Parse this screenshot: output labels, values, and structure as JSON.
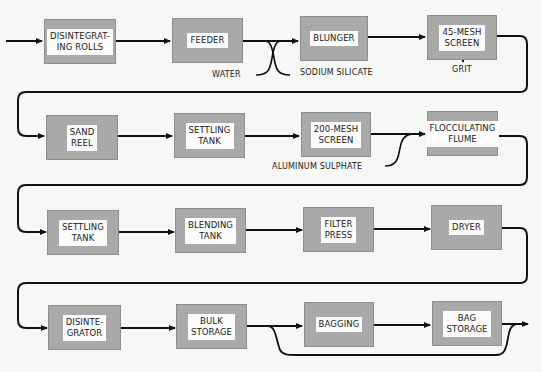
{
  "diagram": {
    "type": "process-flow",
    "rows": [
      {
        "steps": [
          {
            "id": "disintegrating-rolls",
            "label": "DISINTEGRAT-\nING ROLLS"
          },
          {
            "id": "feeder",
            "label": "FEEDER"
          },
          {
            "id": "blunger",
            "label": "BLUNGER"
          },
          {
            "id": "45-mesh-screen",
            "label": "45-MESH\nSCREEN"
          }
        ]
      },
      {
        "steps": [
          {
            "id": "sand-reel",
            "label": "SAND\nREEL"
          },
          {
            "id": "settling-tank-1",
            "label": "SETTLING\nTANK"
          },
          {
            "id": "200-mesh-screen",
            "label": "200-MESH\nSCREEN"
          },
          {
            "id": "flocculating-flume",
            "label": "FLOCCULATING\nFLUME"
          }
        ]
      },
      {
        "steps": [
          {
            "id": "settling-tank-2",
            "label": "SETTLING\nTANK"
          },
          {
            "id": "blending-tank",
            "label": "BLENDING\nTANK"
          },
          {
            "id": "filter-press",
            "label": "FILTER\nPRESS"
          },
          {
            "id": "dryer",
            "label": "DRYER"
          }
        ]
      },
      {
        "steps": [
          {
            "id": "disintegrator",
            "label": "DISINTE-\nGRATOR"
          },
          {
            "id": "bulk-storage",
            "label": "BULK\nSTORAGE"
          },
          {
            "id": "bagging",
            "label": "BAGGING"
          },
          {
            "id": "bag-storage",
            "label": "BAG\nSTORAGE"
          }
        ]
      }
    ],
    "inputs": {
      "water": "WATER",
      "sodium_silicate": "SODIUM SILICATE",
      "aluminum_sulphate": "ALUMINUM  SULPHATE"
    },
    "outputs": {
      "grit": "GRIT"
    },
    "colors": {
      "box_fill": "#a9a9a9",
      "label_fill": "#fbfbfb",
      "line": "#111111",
      "background": "#f7f7f5"
    }
  }
}
